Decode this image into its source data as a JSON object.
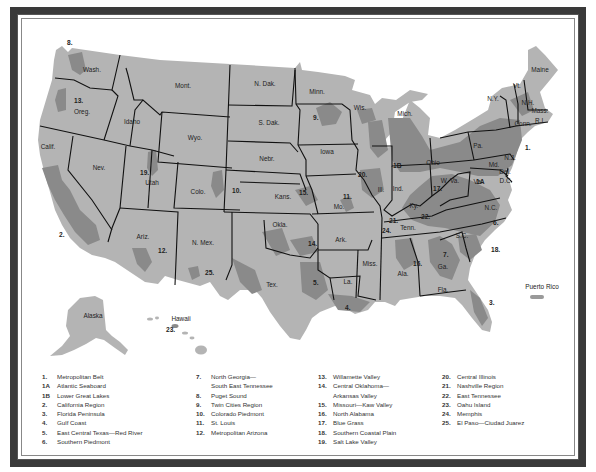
{
  "map": {
    "title": "Metropolitan Regions of the United States",
    "colors": {
      "land": "#b4b4b4",
      "region_shading": "#8a8a8a",
      "borders": "#111111",
      "frame": "#3a3a3a",
      "water": "#ffffff"
    },
    "states": [
      {
        "abbr": "Wash.",
        "x": 92,
        "y": 72
      },
      {
        "abbr": "Oreg.",
        "x": 82,
        "y": 114
      },
      {
        "abbr": "Calif.",
        "x": 48,
        "y": 149
      },
      {
        "abbr": "Idaho",
        "x": 132,
        "y": 124
      },
      {
        "abbr": "Nev.",
        "x": 99,
        "y": 170
      },
      {
        "abbr": "Mont.",
        "x": 183,
        "y": 88
      },
      {
        "abbr": "Wyo.",
        "x": 195,
        "y": 140
      },
      {
        "abbr": "Utah",
        "x": 152,
        "y": 185
      },
      {
        "abbr": "Colo.",
        "x": 198,
        "y": 194
      },
      {
        "abbr": "Ariz.",
        "x": 143,
        "y": 239
      },
      {
        "abbr": "N. Mex.",
        "x": 203,
        "y": 245
      },
      {
        "abbr": "N. Dak.",
        "x": 265,
        "y": 86
      },
      {
        "abbr": "S. Dak.",
        "x": 269,
        "y": 125
      },
      {
        "abbr": "Nebr.",
        "x": 267,
        "y": 161
      },
      {
        "abbr": "Kans.",
        "x": 283,
        "y": 199
      },
      {
        "abbr": "Okla.",
        "x": 280,
        "y": 227
      },
      {
        "abbr": "Tex.",
        "x": 272,
        "y": 287
      },
      {
        "abbr": "Minn.",
        "x": 317,
        "y": 94
      },
      {
        "abbr": "Iowa",
        "x": 327,
        "y": 154
      },
      {
        "abbr": "Mo.",
        "x": 339,
        "y": 209
      },
      {
        "abbr": "Ark.",
        "x": 341,
        "y": 242
      },
      {
        "abbr": "La.",
        "x": 348,
        "y": 284
      },
      {
        "abbr": "Wis.",
        "x": 360,
        "y": 110
      },
      {
        "abbr": "Ill.",
        "x": 381,
        "y": 192
      },
      {
        "abbr": "Mich.",
        "x": 405,
        "y": 116
      },
      {
        "abbr": "Ind.",
        "x": 398,
        "y": 191
      },
      {
        "abbr": "Ohio",
        "x": 433,
        "y": 165
      },
      {
        "abbr": "Ky.",
        "x": 414,
        "y": 208
      },
      {
        "abbr": "Tenn.",
        "x": 408,
        "y": 230
      },
      {
        "abbr": "Miss.",
        "x": 370,
        "y": 266
      },
      {
        "abbr": "Ala.",
        "x": 403,
        "y": 276
      },
      {
        "abbr": "Ga.",
        "x": 443,
        "y": 269
      },
      {
        "abbr": "Fla.",
        "x": 443,
        "y": 292
      },
      {
        "abbr": "S.C.",
        "x": 462,
        "y": 238
      },
      {
        "abbr": "N.C.",
        "x": 491,
        "y": 210
      },
      {
        "abbr": "Va.",
        "x": 478,
        "y": 184
      },
      {
        "abbr": "W. Va.",
        "x": 450,
        "y": 183
      },
      {
        "abbr": "Pa.",
        "x": 478,
        "y": 148
      },
      {
        "abbr": "N.Y.",
        "x": 493,
        "y": 101
      },
      {
        "abbr": "Vt.",
        "x": 517,
        "y": 88
      },
      {
        "abbr": "N.H.",
        "x": 528,
        "y": 105
      },
      {
        "abbr": "Maine",
        "x": 540,
        "y": 72
      },
      {
        "abbr": "Mass.",
        "x": 540,
        "y": 113
      },
      {
        "abbr": "Conn.",
        "x": 523,
        "y": 126
      },
      {
        "abbr": "R.I.",
        "x": 540,
        "y": 123
      },
      {
        "abbr": "N.J.",
        "x": 510,
        "y": 160
      },
      {
        "abbr": "Md.",
        "x": 494,
        "y": 167
      },
      {
        "abbr": "Del.",
        "x": 505,
        "y": 174
      },
      {
        "abbr": "D.C.",
        "x": 506,
        "y": 183
      },
      {
        "abbr": "Alaska",
        "x": 93,
        "y": 318
      },
      {
        "abbr": "Hawaii",
        "x": 181,
        "y": 321
      },
      {
        "abbr": "Puerto Rico",
        "x": 542,
        "y": 289
      }
    ],
    "region_markers": [
      {
        "id": "1.",
        "x": 525,
        "y": 150
      },
      {
        "id": "1A",
        "x": 476,
        "y": 184
      },
      {
        "id": "1B",
        "x": 393,
        "y": 168
      },
      {
        "id": "2.",
        "x": 59,
        "y": 237
      },
      {
        "id": "3.",
        "x": 489,
        "y": 305
      },
      {
        "id": "4.",
        "x": 345,
        "y": 310
      },
      {
        "id": "5.",
        "x": 313,
        "y": 285
      },
      {
        "id": "6.",
        "x": 493,
        "y": 225
      },
      {
        "id": "7.",
        "x": 443,
        "y": 257
      },
      {
        "id": "8.",
        "x": 67,
        "y": 45
      },
      {
        "id": "9.",
        "x": 313,
        "y": 120
      },
      {
        "id": "10.",
        "x": 232,
        "y": 193
      },
      {
        "id": "11.",
        "x": 343,
        "y": 199
      },
      {
        "id": "12.",
        "x": 158,
        "y": 253
      },
      {
        "id": "13.",
        "x": 74,
        "y": 103
      },
      {
        "id": "14.",
        "x": 308,
        "y": 246
      },
      {
        "id": "15.",
        "x": 299,
        "y": 195
      },
      {
        "id": "16.",
        "x": 413,
        "y": 266
      },
      {
        "id": "17.",
        "x": 433,
        "y": 191
      },
      {
        "id": "18.",
        "x": 491,
        "y": 252
      },
      {
        "id": "19.",
        "x": 140,
        "y": 175
      },
      {
        "id": "20.",
        "x": 358,
        "y": 177
      },
      {
        "id": "21.",
        "x": 389,
        "y": 223
      },
      {
        "id": "22.",
        "x": 421,
        "y": 219
      },
      {
        "id": "23.",
        "x": 166,
        "y": 332
      },
      {
        "id": "24.",
        "x": 382,
        "y": 233
      },
      {
        "id": "25.",
        "x": 205,
        "y": 275
      }
    ]
  },
  "legend": {
    "columns": [
      [
        {
          "num": "1.",
          "label": "Metropolitan Belt"
        },
        {
          "num": "1A",
          "label": "Atlantic Seaboard"
        },
        {
          "num": "1B",
          "label": "Lower Great Lakes"
        },
        {
          "num": "2.",
          "label": "California Region"
        },
        {
          "num": "3.",
          "label": "Florida Peninsula"
        },
        {
          "num": "4.",
          "label": "Gulf Coast"
        },
        {
          "num": "5.",
          "label": "East Central Texas—Red River"
        },
        {
          "num": "6.",
          "label": "Southern Piedmont"
        }
      ],
      [
        {
          "num": "7.",
          "label": "North Georgia—",
          "cont": "South East Tennessee"
        },
        {
          "num": "8.",
          "label": "Puget Sound"
        },
        {
          "num": "9.",
          "label": "Twin Cities Region"
        },
        {
          "num": "10.",
          "label": "Colorado Piedmont"
        },
        {
          "num": "11.",
          "label": "St. Louis"
        },
        {
          "num": "12.",
          "label": "Metropolitan Arizona"
        }
      ],
      [
        {
          "num": "13.",
          "label": "Willamette Valley"
        },
        {
          "num": "14.",
          "label": "Central Oklahoma—",
          "cont": "Arkansas Valley"
        },
        {
          "num": "15.",
          "label": "Missouri—Kaw Valley"
        },
        {
          "num": "16.",
          "label": "North Alabama"
        },
        {
          "num": "17.",
          "label": "Blue Grass"
        },
        {
          "num": "18.",
          "label": "Southern Coastal Plain"
        },
        {
          "num": "19.",
          "label": "Salt Lake Valley"
        }
      ],
      [
        {
          "num": "20.",
          "label": "Central Illinois"
        },
        {
          "num": "21.",
          "label": "Nashville Region"
        },
        {
          "num": "22.",
          "label": "East Tennessee"
        },
        {
          "num": "23.",
          "label": "Oahu Island"
        },
        {
          "num": "24.",
          "label": "Memphis"
        },
        {
          "num": "25.",
          "label": "El Paso—Ciudad Juarez"
        }
      ]
    ]
  }
}
